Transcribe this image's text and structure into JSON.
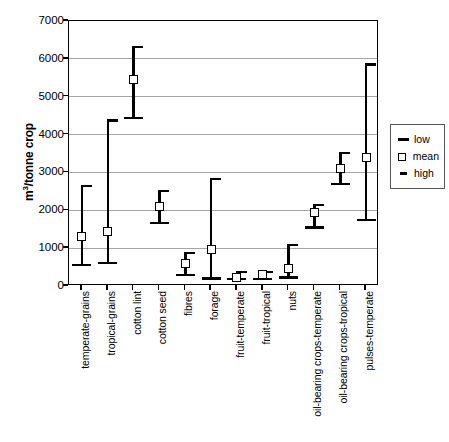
{
  "chart_data": {
    "type": "scatter",
    "title": "",
    "xlabel": "",
    "ylabel_html": "m3/tonne crop",
    "ylim": [
      0,
      7000
    ],
    "yticks": [
      0,
      1000,
      2000,
      3000,
      4000,
      5000,
      6000,
      7000
    ],
    "ytick_labels": [
      "0",
      "1000",
      "2000",
      "3000",
      "4000",
      "5000",
      "6000",
      "7000"
    ],
    "grid": true,
    "legend_position": "right",
    "categories": [
      "temperate-grains",
      "tropical-grains",
      "cotton lint",
      "cotton seed",
      "fibres",
      "forage",
      "fruit-temperate",
      "fruit-tropical",
      "nuts",
      "oil-bearing crops-temperate",
      "oil-bearing crops-tropical",
      "pulses-temperate"
    ],
    "series": [
      {
        "name": "low",
        "values": [
          560,
          610,
          4440,
          1670,
          290,
          195,
          180,
          185,
          220,
          1550,
          2690,
          1740
        ]
      },
      {
        "name": "mean",
        "values": [
          1310,
          1450,
          5450,
          2100,
          590,
          960,
          230,
          300,
          450,
          1930,
          3100,
          3400
        ]
      },
      {
        "name": "high",
        "values": [
          2640,
          4370,
          6310,
          2500,
          880,
          2820,
          380,
          370,
          1090,
          2130,
          3520,
          5850
        ]
      }
    ],
    "legend": [
      {
        "label": "low",
        "marker": "thick-dash"
      },
      {
        "label": "mean",
        "marker": "open-square"
      },
      {
        "label": "high",
        "marker": "thin-dash"
      }
    ],
    "colors": {
      "marker": "#000000",
      "gridline": "#a6a6a6",
      "axis": "#000000",
      "background": "#ffffff"
    }
  }
}
